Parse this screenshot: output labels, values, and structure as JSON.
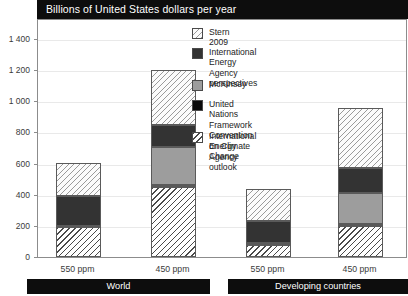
{
  "chart_data": {
    "type": "bar",
    "subtype": "stacked-bar-grouped",
    "title": "Billions of United States dollars per year",
    "xlabel": "",
    "ylabel": "",
    "ylim": [
      0,
      1400
    ],
    "ytick_step": 200,
    "yticks": [
      "0",
      "200",
      "400",
      "600",
      "800",
      "1 000",
      "1 200",
      "1 400"
    ],
    "grid": true,
    "legend_position": "inside-top-center",
    "categories": [
      "550 ppm",
      "450 ppm",
      "550 ppm",
      "450 ppm"
    ],
    "groups": [
      {
        "label": "World",
        "categories": [
          "550 ppm",
          "450 ppm"
        ]
      },
      {
        "label": "Developing countries",
        "categories": [
          "550 ppm",
          "450 ppm"
        ]
      }
    ],
    "series": [
      {
        "name": "International Energy Agency outlook",
        "legend_label": "International Energy\nAgency outlook",
        "fill": "iea-outlook",
        "color": "#ffffff",
        "pattern": "diagonal-hatch-dark",
        "values": [
          190,
          450,
          80,
          200
        ]
      },
      {
        "name": "United Nations Framework Convention on Climate Change",
        "legend_label": "United Nations Framework\nConvention on Climate Change",
        "fill": "unfccc",
        "color": "#0a0a0a",
        "pattern": "solid",
        "values": [
          10,
          10,
          10,
          10
        ]
      },
      {
        "name": "McKinsey",
        "legend_label": "McKinsey",
        "fill": "mckinsey",
        "color": "#9d9d9d",
        "pattern": "solid",
        "values": [
          0,
          245,
          0,
          200
        ]
      },
      {
        "name": "International Energy Agency perspectives",
        "legend_label": "International Energy\nAgency perspectives",
        "fill": "iea-persp",
        "color": "#333333",
        "pattern": "solid",
        "values": [
          195,
          145,
          140,
          160
        ]
      },
      {
        "name": "Stern 2009",
        "legend_label": "Stern 2009",
        "fill": "stern",
        "color": "#fbfbfb",
        "pattern": "diagonal-hatch-light",
        "values": [
          210,
          350,
          210,
          390
        ]
      }
    ],
    "totals": [
      605,
      1200,
      440,
      960
    ]
  },
  "legend": {
    "items": [
      {
        "label": "Stern 2009",
        "fill": "stern"
      },
      {
        "label": "International Energy\nAgency perspectives",
        "fill": "iea-persp"
      },
      {
        "label": "McKinsey",
        "fill": "mckinsey"
      },
      {
        "label": "United Nations Framework\nConvention on Climate Change",
        "fill": "unfccc"
      },
      {
        "label": "International Energy\nAgency outlook",
        "fill": "iea-outlook"
      }
    ]
  },
  "colors": {
    "title_bg": "#0d0d0d",
    "title_fg": "#ffffff",
    "axis": "#8c8c8c",
    "grid": "#e9e9e9",
    "group_bar_bg": "#0d0d0d",
    "group_bar_fg": "#ffffff"
  }
}
